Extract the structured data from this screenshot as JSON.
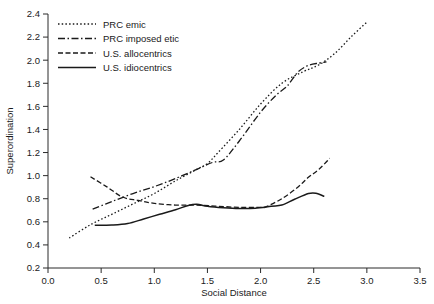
{
  "chart_data": {
    "type": "line",
    "title": "",
    "xlabel": "Social Distance",
    "ylabel": "Superordination",
    "xlim": [
      0.0,
      3.5
    ],
    "ylim": [
      0.2,
      2.4
    ],
    "xticks": [
      "0.0",
      "0.5",
      "1.0",
      "1.5",
      "2.0",
      "2.5",
      "3.0",
      "3.5"
    ],
    "yticks": [
      "0.2",
      "0.4",
      "0.6",
      "0.8",
      "1.0",
      "1.2",
      "1.4",
      "1.6",
      "1.8",
      "2.0",
      "2.2",
      "2.4"
    ],
    "grid": false,
    "legend_position": "upper-left-inside",
    "series": [
      {
        "name": "PRC emic",
        "style": "dotted",
        "dasharray": "1.5,2.2",
        "width": 1.3,
        "points": [
          [
            0.2,
            0.46
          ],
          [
            0.4,
            0.575
          ],
          [
            0.6,
            0.665
          ],
          [
            0.8,
            0.755
          ],
          [
            1.0,
            0.845
          ],
          [
            1.2,
            0.955
          ],
          [
            1.4,
            1.055
          ],
          [
            1.5,
            1.105
          ],
          [
            1.6,
            1.2
          ],
          [
            1.8,
            1.4
          ],
          [
            2.0,
            1.62
          ],
          [
            2.2,
            1.8
          ],
          [
            2.4,
            1.9
          ],
          [
            2.55,
            1.96
          ],
          [
            2.7,
            2.06
          ],
          [
            2.85,
            2.2
          ],
          [
            3.0,
            2.33
          ]
        ]
      },
      {
        "name": "PRC imposed etic",
        "style": "dash-dot",
        "dasharray": "7,2.5,1.5,2.5",
        "width": 1.3,
        "points": [
          [
            0.42,
            0.71
          ],
          [
            0.6,
            0.775
          ],
          [
            0.8,
            0.845
          ],
          [
            1.0,
            0.905
          ],
          [
            1.2,
            0.975
          ],
          [
            1.4,
            1.055
          ],
          [
            1.55,
            1.115
          ],
          [
            1.65,
            1.135
          ],
          [
            1.8,
            1.3
          ],
          [
            2.0,
            1.55
          ],
          [
            2.15,
            1.7
          ],
          [
            2.25,
            1.775
          ],
          [
            2.35,
            1.895
          ],
          [
            2.45,
            1.955
          ],
          [
            2.55,
            1.975
          ],
          [
            2.62,
            1.985
          ]
        ]
      },
      {
        "name": "U.S. allocentrics",
        "style": "dashed",
        "dasharray": "5,2.5",
        "width": 1.3,
        "points": [
          [
            0.4,
            0.99
          ],
          [
            0.55,
            0.905
          ],
          [
            0.7,
            0.815
          ],
          [
            0.85,
            0.785
          ],
          [
            1.0,
            0.76
          ],
          [
            1.2,
            0.745
          ],
          [
            1.4,
            0.745
          ],
          [
            1.6,
            0.735
          ],
          [
            1.8,
            0.725
          ],
          [
            2.0,
            0.725
          ],
          [
            2.05,
            0.73
          ],
          [
            2.2,
            0.8
          ],
          [
            2.35,
            0.9
          ],
          [
            2.45,
            0.985
          ],
          [
            2.55,
            1.055
          ],
          [
            2.65,
            1.15
          ]
        ]
      },
      {
        "name": "U.S. idiocentrics",
        "style": "solid",
        "dasharray": "",
        "width": 1.5,
        "points": [
          [
            0.44,
            0.57
          ],
          [
            0.6,
            0.572
          ],
          [
            0.75,
            0.585
          ],
          [
            0.9,
            0.625
          ],
          [
            1.05,
            0.665
          ],
          [
            1.2,
            0.705
          ],
          [
            1.32,
            0.742
          ],
          [
            1.4,
            0.752
          ],
          [
            1.5,
            0.735
          ],
          [
            1.65,
            0.722
          ],
          [
            1.8,
            0.715
          ],
          [
            1.95,
            0.718
          ],
          [
            2.1,
            0.735
          ],
          [
            2.2,
            0.745
          ],
          [
            2.32,
            0.795
          ],
          [
            2.45,
            0.845
          ],
          [
            2.52,
            0.848
          ],
          [
            2.6,
            0.82
          ]
        ]
      }
    ],
    "legend": [
      {
        "label": "PRC emic"
      },
      {
        "label": "PRC imposed etic"
      },
      {
        "label": "U.S. allocentrics"
      },
      {
        "label": "U.S. idiocentrics"
      }
    ]
  }
}
